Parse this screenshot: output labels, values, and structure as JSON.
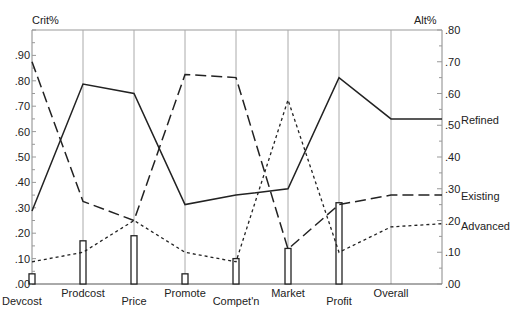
{
  "chart_data": {
    "type": "line",
    "title": "",
    "left_axis": {
      "label": "Crit%",
      "ticks": [
        ".00",
        ".10",
        ".20",
        ".30",
        ".40",
        ".50",
        ".60",
        ".70",
        ".80",
        ".90"
      ],
      "range": [
        0,
        1.0
      ]
    },
    "right_axis": {
      "label": "Alt%",
      "ticks": [
        ".00",
        ".10",
        ".20",
        ".30",
        ".40",
        ".50",
        ".60",
        ".70",
        ".80"
      ],
      "range": [
        0,
        0.8
      ]
    },
    "categories": [
      "Devcost",
      "Prodcost",
      "Price",
      "Promote",
      "Compet'n",
      "Market",
      "Profit",
      "Overall"
    ],
    "bars": {
      "name": "Crit%",
      "axis": "left",
      "values": [
        0.04,
        0.17,
        0.19,
        0.04,
        0.1,
        0.14,
        0.32,
        null
      ]
    },
    "series": [
      {
        "name": "Refined",
        "style": "solid",
        "axis": "right",
        "values": [
          0.23,
          0.63,
          0.6,
          0.25,
          0.28,
          0.3,
          0.65,
          0.52
        ],
        "end_value": 0.52
      },
      {
        "name": "Existing",
        "style": "dashed",
        "axis": "right",
        "values": [
          0.7,
          0.26,
          0.2,
          0.66,
          0.65,
          0.11,
          0.25,
          0.28
        ],
        "end_value": 0.28
      },
      {
        "name": "Advanced",
        "style": "dotted",
        "axis": "right",
        "values": [
          0.07,
          0.1,
          0.2,
          0.1,
          0.07,
          0.58,
          0.1,
          0.18
        ],
        "end_value": 0.19
      }
    ],
    "grid": "vertical lines at categories",
    "legend": "inline labels at right end of lines"
  },
  "labels": {
    "left_axis_title": "Crit%",
    "right_axis_title": "Alt%",
    "series_refined": "Refined",
    "series_existing": "Existing",
    "series_advanced": "Advanced"
  }
}
